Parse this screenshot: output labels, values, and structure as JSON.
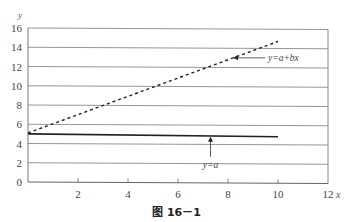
{
  "chart_data": {
    "type": "line",
    "title": "",
    "caption": "图 16－1",
    "xlabel": "x",
    "ylabel": "y",
    "xlim": [
      0,
      12
    ],
    "ylim": [
      0,
      16
    ],
    "x_ticks": [
      2,
      4,
      6,
      8,
      10,
      12
    ],
    "y_ticks": [
      0,
      2,
      4,
      6,
      8,
      10,
      12,
      14,
      16
    ],
    "grid": "horizontal",
    "series": [
      {
        "name": "y=a+bx",
        "style": "dashed",
        "x": [
          0,
          10
        ],
        "y": [
          5.1,
          14.6
        ]
      },
      {
        "name": "y=a",
        "style": "solid",
        "x": [
          0,
          10
        ],
        "y": [
          5.0,
          4.7
        ]
      }
    ],
    "annotations": [
      {
        "text": "y=a+bx",
        "arrow_to": [
          8.2,
          12.9
        ],
        "label_at": [
          9.4,
          12.8
        ]
      },
      {
        "text": "y=a",
        "arrow_to": [
          7.3,
          4.8
        ],
        "label_at": [
          7.3,
          2.6
        ]
      }
    ]
  },
  "labels": {
    "x_axis": "x",
    "y_axis": "y",
    "x_tick_labels": [
      "2",
      "4",
      "6",
      "8",
      "10",
      "12"
    ],
    "y_tick_labels": [
      "0",
      "2",
      "4",
      "6",
      "8",
      "10",
      "12",
      "14",
      "16"
    ],
    "annotation_line1": "y=a+bx",
    "annotation_line2": "y=a",
    "caption": "图 16－1"
  }
}
